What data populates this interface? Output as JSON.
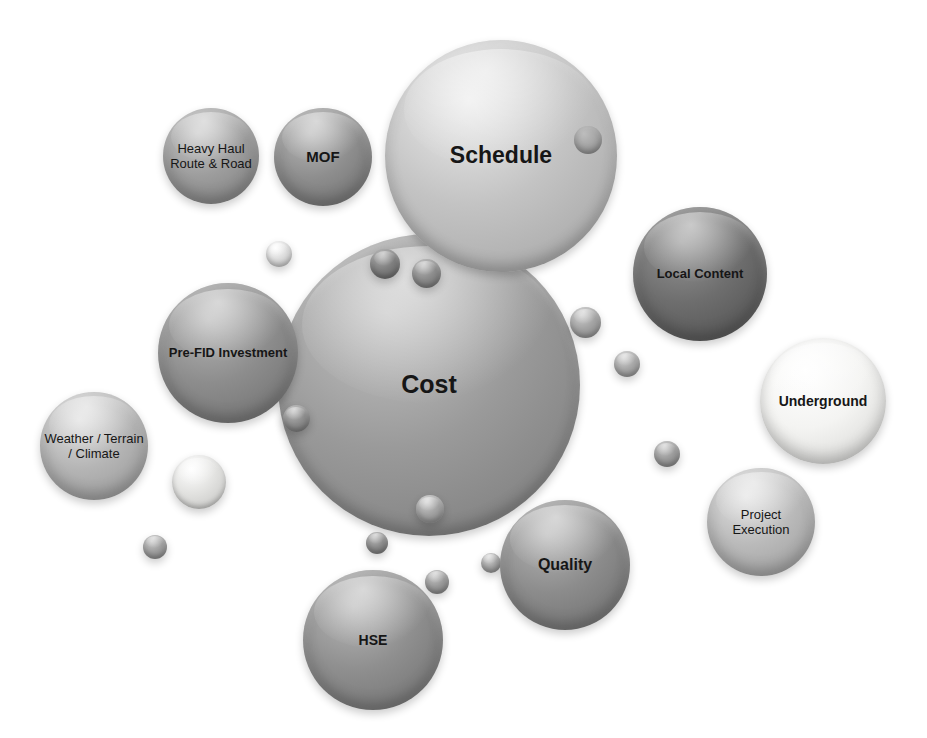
{
  "diagram": {
    "background_color": "#ffffff",
    "width": 927,
    "height": 738
  },
  "chart_data": {
    "type": "bubble",
    "xlabel": "",
    "ylabel": "",
    "grid": false,
    "legend": "none",
    "note": "Relative bubble area encodes risk magnitude; gray shade varies per bubble.",
    "categories": [
      "Cost",
      "Schedule",
      "Local Content",
      "Underground",
      "Pre-FID Investment",
      "HSE",
      "Quality",
      "Heavy Haul Route & Road",
      "MOF",
      "Weather / Terrain / Climate",
      "Project Execution"
    ],
    "values": [
      285,
      220,
      130,
      124,
      136,
      136,
      128,
      92,
      96,
      104,
      104
    ],
    "value_unit": "bubble diameter (px)",
    "colors": [
      "#9a9a9a",
      "#c2c2c2",
      "#6d6d6d",
      "#f2f2f0",
      "#8d8d8d",
      "#8f8f8f",
      "#8c8c8c",
      "#9d9d9d",
      "#8e8e8e",
      "#b4b4b4",
      "#b9b9b9"
    ]
  },
  "bubbles": [
    {
      "id": "cost",
      "label": "Cost",
      "x": 278,
      "y": 234,
      "size": 302,
      "color": "#9a9a9a",
      "font_size": 25,
      "font_weight": "bold",
      "z": 3
    },
    {
      "id": "schedule",
      "label": "Schedule",
      "x": 385,
      "y": 40,
      "size": 232,
      "color": "#c3c3c3",
      "font_size": 23,
      "font_weight": "bold",
      "z": 4
    },
    {
      "id": "local-content",
      "label": "Local Content",
      "x": 633,
      "y": 207,
      "size": 134,
      "color": "#6e6e6e",
      "font_size": 13,
      "font_weight": "bold",
      "z": 5
    },
    {
      "id": "underground",
      "label": "Underground",
      "x": 760,
      "y": 338,
      "size": 126,
      "color": "#f4f4f2",
      "font_size": 14,
      "font_weight": "bold",
      "z": 5
    },
    {
      "id": "pre-fid-investment",
      "label": "Pre-FID Investment",
      "x": 158,
      "y": 283,
      "size": 140,
      "color": "#8d8d8d",
      "font_size": 13,
      "font_weight": "bold",
      "z": 5
    },
    {
      "id": "hse",
      "label": "HSE",
      "x": 303,
      "y": 570,
      "size": 140,
      "color": "#8f8f8f",
      "font_size": 14,
      "font_weight": "bold",
      "z": 5
    },
    {
      "id": "quality",
      "label": "Quality",
      "x": 500,
      "y": 500,
      "size": 130,
      "color": "#8c8c8c",
      "font_size": 16,
      "font_weight": "bold",
      "z": 5
    },
    {
      "id": "heavy-haul-route-road",
      "label": "Heavy Haul Route & Road",
      "x": 163,
      "y": 108,
      "size": 96,
      "color": "#9d9d9d",
      "font_size": 13,
      "font_weight": "normal",
      "z": 5
    },
    {
      "id": "mof",
      "label": "MOF",
      "x": 274,
      "y": 108,
      "size": 98,
      "color": "#8e8e8e",
      "font_size": 15,
      "font_weight": "bold",
      "z": 5
    },
    {
      "id": "weather-terrain-climate",
      "label": "Weather / Terrain / Climate",
      "x": 40,
      "y": 392,
      "size": 108,
      "color": "#b5b5b5",
      "font_size": 13,
      "font_weight": "normal",
      "z": 5
    },
    {
      "id": "project-execution",
      "label": "Project Execution",
      "x": 707,
      "y": 468,
      "size": 108,
      "color": "#bababa",
      "font_size": 13,
      "font_weight": "normal",
      "z": 5
    }
  ],
  "satellites": [
    {
      "id": "sat-1",
      "x": 266,
      "y": 241,
      "size": 26,
      "color": "#dcdcdc",
      "z": 6
    },
    {
      "id": "sat-2",
      "x": 370,
      "y": 249,
      "size": 30,
      "color": "#7e7e7e",
      "z": 6
    },
    {
      "id": "sat-3",
      "x": 412,
      "y": 259,
      "size": 29,
      "color": "#8b8b8b",
      "z": 6
    },
    {
      "id": "sat-4",
      "x": 570,
      "y": 307,
      "size": 31,
      "color": "#a3a3a3",
      "z": 6
    },
    {
      "id": "sat-5",
      "x": 614,
      "y": 351,
      "size": 26,
      "color": "#a7a7a7",
      "z": 6
    },
    {
      "id": "sat-6",
      "x": 283,
      "y": 405,
      "size": 27,
      "color": "#8d8d8d",
      "z": 6
    },
    {
      "id": "sat-7",
      "x": 172,
      "y": 455,
      "size": 54,
      "color": "#e2e2e0",
      "z": 2
    },
    {
      "id": "sat-8",
      "x": 143,
      "y": 535,
      "size": 24,
      "color": "#9e9e9e",
      "z": 2
    },
    {
      "id": "sat-9",
      "x": 416,
      "y": 495,
      "size": 28,
      "color": "#a2a2a2",
      "z": 6
    },
    {
      "id": "sat-10",
      "x": 366,
      "y": 532,
      "size": 22,
      "color": "#8c8c8c",
      "z": 6
    },
    {
      "id": "sat-11",
      "x": 425,
      "y": 570,
      "size": 24,
      "color": "#999999",
      "z": 2
    },
    {
      "id": "sat-12",
      "x": 481,
      "y": 553,
      "size": 20,
      "color": "#a6a6a6",
      "z": 4
    },
    {
      "id": "sat-13",
      "x": 654,
      "y": 441,
      "size": 26,
      "color": "#9b9b9b",
      "z": 2
    },
    {
      "id": "sat-14",
      "x": 636,
      "y": 273,
      "size": 22,
      "color": "#8f8f8f",
      "z": 2
    }
  ],
  "inner_dots": [
    {
      "id": "schedule-inner-dot",
      "parent": "schedule",
      "x": 574,
      "y": 126,
      "size": 28,
      "color": "#9e9e9e"
    }
  ]
}
